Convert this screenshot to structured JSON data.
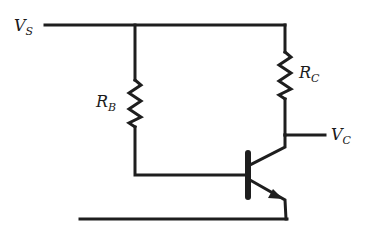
{
  "diagram": {
    "type": "transistor-bias-circuit",
    "labels": {
      "vs": {
        "main": "V",
        "sub": "S"
      },
      "rb": {
        "main": "R",
        "sub": "B"
      },
      "rc": {
        "main": "R",
        "sub": "C"
      },
      "vc": {
        "main": "V",
        "sub": "C"
      }
    },
    "components": [
      {
        "id": "rb",
        "kind": "resistor",
        "label": "R_B"
      },
      {
        "id": "rc",
        "kind": "resistor",
        "label": "R_C"
      },
      {
        "id": "q1",
        "kind": "npn-transistor"
      }
    ],
    "nodes": [
      "V_S",
      "V_C",
      "ground"
    ],
    "colors": {
      "line": "#1e1e1e",
      "background": "#ffffff"
    }
  }
}
